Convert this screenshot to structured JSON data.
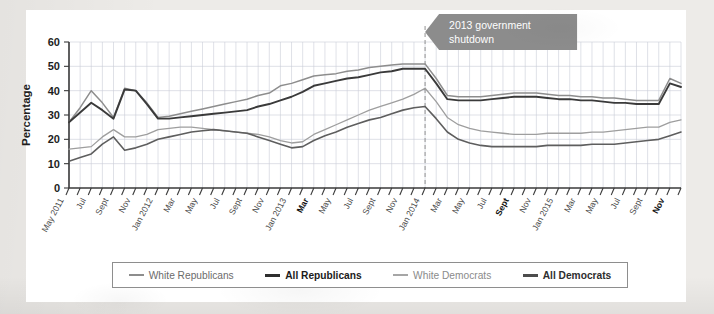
{
  "chart_data": {
    "type": "line",
    "title": "",
    "xlabel": "",
    "ylabel": "Percentage",
    "ylim": [
      0,
      60
    ],
    "yticks": [
      0,
      10,
      20,
      30,
      40,
      50,
      60
    ],
    "grid": true,
    "legend_position": "bottom",
    "x": [
      "May 2011",
      "Jun 2011",
      "Jul 2011",
      "Aug 2011",
      "Sept 2011",
      "Oct 2011",
      "Nov 2011",
      "Dec 2011",
      "Jan 2012",
      "Feb 2012",
      "Mar 2012",
      "Apr 2012",
      "May 2012",
      "Jun 2012",
      "Jul 2012",
      "Aug 2012",
      "Sept 2012",
      "Oct 2012",
      "Nov 2012",
      "Dec 2012",
      "Jan 2013",
      "Feb 2013",
      "Mar 2013",
      "Apr 2013",
      "May 2013",
      "Jun 2013",
      "Jul 2013",
      "Aug 2013",
      "Sept 2013",
      "Oct 2013",
      "Nov 2013",
      "Dec 2013",
      "Jan 2014",
      "Feb 2014",
      "Mar 2014",
      "Apr 2014",
      "May 2014",
      "Jun 2014",
      "Jul 2014",
      "Aug 2014",
      "Sept 2014",
      "Oct 2014",
      "Nov 2014",
      "Dec 2014",
      "Jan 2015",
      "Feb 2015",
      "Mar 2015",
      "Apr 2015",
      "May 2015",
      "Jun 2015",
      "Jul 2015",
      "Aug 2015",
      "Sept 2015",
      "Oct 2015",
      "Nov 2015",
      "Dec 2015"
    ],
    "xtick_labels": [
      {
        "index": 0,
        "label": "May 2011",
        "bold": false
      },
      {
        "index": 2,
        "label": "Jul",
        "bold": false
      },
      {
        "index": 4,
        "label": "Sept",
        "bold": false
      },
      {
        "index": 6,
        "label": "Nov",
        "bold": false
      },
      {
        "index": 8,
        "label": "Jan 2012",
        "bold": false
      },
      {
        "index": 10,
        "label": "Mar",
        "bold": false
      },
      {
        "index": 12,
        "label": "May",
        "bold": false
      },
      {
        "index": 14,
        "label": "Jul",
        "bold": false
      },
      {
        "index": 16,
        "label": "Sept",
        "bold": false
      },
      {
        "index": 18,
        "label": "Nov",
        "bold": false
      },
      {
        "index": 20,
        "label": "Jan 2013",
        "bold": false
      },
      {
        "index": 22,
        "label": "Mar",
        "bold": true
      },
      {
        "index": 24,
        "label": "May",
        "bold": false
      },
      {
        "index": 26,
        "label": "Jul",
        "bold": false
      },
      {
        "index": 28,
        "label": "Sept",
        "bold": false
      },
      {
        "index": 30,
        "label": "Nov",
        "bold": false
      },
      {
        "index": 32,
        "label": "Jan 2014",
        "bold": false
      },
      {
        "index": 34,
        "label": "Mar",
        "bold": false
      },
      {
        "index": 36,
        "label": "May",
        "bold": false
      },
      {
        "index": 38,
        "label": "Jul",
        "bold": false
      },
      {
        "index": 40,
        "label": "Sept",
        "bold": true
      },
      {
        "index": 42,
        "label": "Nov",
        "bold": false
      },
      {
        "index": 44,
        "label": "Jan 2015",
        "bold": false
      },
      {
        "index": 46,
        "label": "Mar",
        "bold": false
      },
      {
        "index": 48,
        "label": "May",
        "bold": false
      },
      {
        "index": 50,
        "label": "Jul",
        "bold": false
      },
      {
        "index": 52,
        "label": "Sept",
        "bold": false
      },
      {
        "index": 54,
        "label": "Nov",
        "bold": true
      }
    ],
    "series": [
      {
        "name": "White Republicans",
        "color": "#8d8d8d",
        "width": 1.5,
        "values": [
          27,
          33,
          40,
          35,
          29,
          41,
          40,
          35,
          29,
          29.5,
          30.5,
          31.5,
          32.5,
          33.5,
          34.5,
          35.5,
          36.5,
          38,
          39,
          42,
          43,
          44.5,
          46,
          46.5,
          47,
          48,
          48.5,
          49.5,
          50,
          50.5,
          51,
          51,
          51,
          45,
          38,
          37.5,
          37.5,
          37.5,
          38,
          38.5,
          39,
          39,
          39,
          38.5,
          38,
          38,
          37.5,
          37.5,
          37,
          37,
          36.5,
          36,
          36,
          36,
          45,
          43
        ]
      },
      {
        "name": "All Republicans",
        "color": "#3a3a3a",
        "width": 1.9,
        "values": [
          27,
          31,
          35,
          32,
          28.5,
          40.5,
          40,
          34.5,
          28.5,
          28.5,
          29,
          29.5,
          30,
          30.5,
          31,
          31.5,
          32,
          33.5,
          34.5,
          36,
          37.5,
          39.5,
          42,
          43,
          44,
          45,
          45.5,
          46.5,
          47.5,
          48,
          49,
          49,
          49,
          43,
          36.5,
          36,
          36,
          36,
          36.5,
          37,
          37.5,
          37.5,
          37.5,
          37,
          36.5,
          36.5,
          36,
          36,
          35.5,
          35,
          35,
          34.5,
          34.5,
          34.5,
          43,
          41.5
        ]
      },
      {
        "name": "White Democrats",
        "color": "#9e9e9e",
        "width": 1.3,
        "values": [
          16,
          16.5,
          17,
          21,
          24,
          21,
          21,
          22,
          24,
          24.5,
          25,
          25,
          24.5,
          24,
          23.5,
          23,
          22.5,
          22,
          21,
          19.5,
          18.5,
          19,
          22,
          24,
          26,
          28,
          30,
          32,
          33.5,
          35,
          36.5,
          38.5,
          41,
          35.5,
          29,
          26,
          24.5,
          23.5,
          23,
          22.5,
          22,
          22,
          22,
          22.5,
          22.5,
          22.5,
          22.5,
          23,
          23,
          23.5,
          24,
          24.5,
          25,
          25,
          27,
          28
        ]
      },
      {
        "name": "All Democrats",
        "color": "#5e5e5e",
        "width": 1.6,
        "values": [
          11,
          12.5,
          14,
          18,
          21,
          15.5,
          16.5,
          18,
          20,
          21,
          22,
          23,
          23.5,
          24,
          23.5,
          23,
          22.5,
          21,
          19.5,
          18,
          16.5,
          17,
          19.5,
          21.5,
          23,
          25,
          26.5,
          28,
          29,
          30.5,
          32,
          33,
          33.5,
          28.5,
          23,
          20,
          18.5,
          17.5,
          17,
          17,
          17,
          17,
          17,
          17.5,
          17.5,
          17.5,
          17.5,
          18,
          18,
          18,
          18.5,
          19,
          19.5,
          20,
          21.5,
          23
        ]
      }
    ],
    "annotations": [
      {
        "text_line1": "2013 government",
        "text_line2": "shutdown",
        "marker": "dashed-vertical-line",
        "marker_x_label": "Jan 2014",
        "color": "#8c8c8c"
      }
    ]
  },
  "legend": {
    "items": [
      {
        "label": "White Republicans",
        "color": "#8d8d8d",
        "width": 2,
        "bold": false,
        "text_color": "#6b6b6b"
      },
      {
        "label": "All Republicans",
        "color": "#2e2e2e",
        "width": 3,
        "bold": true,
        "text_color": "#1b1b1b"
      },
      {
        "label": "White Democrats",
        "color": "#a6a6a6",
        "width": 2,
        "bold": false,
        "text_color": "#8a8a8a"
      },
      {
        "label": "All Democrats",
        "color": "#4d4d4d",
        "width": 3,
        "bold": true,
        "text_color": "#2e2e2e"
      }
    ]
  }
}
